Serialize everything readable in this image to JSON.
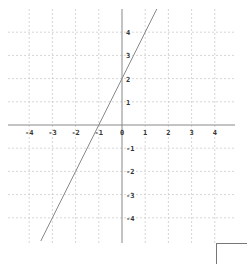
{
  "chart_data": {
    "type": "line",
    "title": "",
    "xlabel": "",
    "ylabel": "",
    "xlim": [
      -5,
      5
    ],
    "ylim": [
      -5,
      5
    ],
    "grid": true,
    "x_ticks": [
      -4,
      -3,
      -2,
      -1,
      0,
      1,
      2,
      3,
      4
    ],
    "y_ticks": [
      -4,
      -3,
      -2,
      -1,
      1,
      2,
      3,
      4
    ],
    "series": [
      {
        "name": "y = 2x + 2",
        "equation": "y = 2x + 2",
        "slope": 2,
        "intercept": 2,
        "x": [
          -3.5,
          -3,
          -2,
          -1,
          0,
          1,
          1.5
        ],
        "y": [
          -5,
          -4,
          -2,
          0,
          2,
          4,
          5
        ],
        "color": "#888888"
      }
    ]
  },
  "colors": {
    "axis": "#888888",
    "grid": "#cccccc",
    "line": "#888888",
    "tick_text": "#333333"
  }
}
